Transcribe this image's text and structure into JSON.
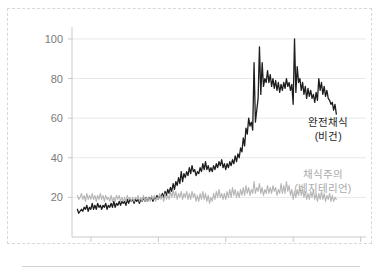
{
  "chart_data": {
    "type": "line",
    "title": "",
    "subtitle": "",
    "xlabel": "",
    "ylabel": "",
    "xlim": [
      2003.6,
      2025.4
    ],
    "ylim": [
      0,
      104
    ],
    "grid": true,
    "grid_axis": "y",
    "legend_position": "inline-right",
    "x_ticks": [
      "2005",
      "2010",
      "2015",
      "2020",
      "2025"
    ],
    "x_tick_values": [
      2005,
      2010,
      2015,
      2020,
      2025
    ],
    "y_ticks": [
      "20",
      "40",
      "60",
      "80",
      "100"
    ],
    "y_tick_values": [
      20,
      40,
      60,
      80,
      100
    ],
    "series": [
      {
        "name": "완전채식 (비건)",
        "label_line1": "완전채식",
        "label_line2": "(비건)",
        "color": "#1d1d1d",
        "label_x": 2022.6,
        "label_y": 56,
        "x": [
          2004.0,
          2004.1,
          2004.2,
          2004.3,
          2004.4,
          2004.5,
          2004.6,
          2004.7,
          2004.8,
          2004.9,
          2005.0,
          2005.1,
          2005.2,
          2005.3,
          2005.4,
          2005.5,
          2005.6,
          2005.7,
          2005.8,
          2005.9,
          2006.0,
          2006.1,
          2006.2,
          2006.3,
          2006.4,
          2006.5,
          2006.6,
          2006.7,
          2006.8,
          2006.9,
          2007.0,
          2007.1,
          2007.2,
          2007.3,
          2007.4,
          2007.5,
          2007.6,
          2007.7,
          2007.8,
          2007.9,
          2008.0,
          2008.1,
          2008.2,
          2008.3,
          2008.4,
          2008.5,
          2008.6,
          2008.7,
          2008.8,
          2008.9,
          2009.0,
          2009.1,
          2009.2,
          2009.3,
          2009.4,
          2009.5,
          2009.6,
          2009.7,
          2009.8,
          2009.9,
          2010.0,
          2010.1,
          2010.2,
          2010.3,
          2010.4,
          2010.5,
          2010.6,
          2010.7,
          2010.8,
          2010.9,
          2011.0,
          2011.1,
          2011.2,
          2011.3,
          2011.4,
          2011.5,
          2011.6,
          2011.7,
          2011.8,
          2011.9,
          2012.0,
          2012.1,
          2012.2,
          2012.3,
          2012.4,
          2012.5,
          2012.6,
          2012.7,
          2012.8,
          2012.9,
          2013.0,
          2013.1,
          2013.2,
          2013.3,
          2013.4,
          2013.5,
          2013.6,
          2013.7,
          2013.8,
          2013.9,
          2014.0,
          2014.1,
          2014.2,
          2014.3,
          2014.4,
          2014.5,
          2014.6,
          2014.7,
          2014.8,
          2014.9,
          2015.0,
          2015.1,
          2015.2,
          2015.3,
          2015.4,
          2015.5,
          2015.6,
          2015.7,
          2015.8,
          2015.9,
          2016.0,
          2016.1,
          2016.2,
          2016.3,
          2016.4,
          2016.5,
          2016.6,
          2016.7,
          2016.8,
          2016.9,
          2017.0,
          2017.1,
          2017.2,
          2017.3,
          2017.4,
          2017.5,
          2017.6,
          2017.7,
          2017.8,
          2017.9,
          2018.0,
          2018.1,
          2018.2,
          2018.3,
          2018.4,
          2018.5,
          2018.6,
          2018.7,
          2018.8,
          2018.9,
          2019.0,
          2019.1,
          2019.2,
          2019.3,
          2019.4,
          2019.5,
          2019.6,
          2019.7,
          2019.8,
          2019.9,
          2020.0,
          2020.1,
          2020.2,
          2020.3,
          2020.4,
          2020.5,
          2020.6,
          2020.7,
          2020.8,
          2020.9,
          2021.0,
          2021.1,
          2021.2,
          2021.3,
          2021.4,
          2021.5,
          2021.6,
          2021.7,
          2021.8,
          2021.9,
          2022.0,
          2022.1,
          2022.2,
          2022.3,
          2022.4,
          2022.5,
          2022.6,
          2022.7,
          2022.8,
          2022.9,
          2023.0,
          2023.1,
          2023.2
        ],
        "y": [
          14,
          12,
          13,
          14,
          13,
          15,
          14,
          16,
          13,
          15,
          14,
          17,
          14,
          16,
          14,
          17,
          15,
          16,
          14,
          16,
          15,
          17,
          14,
          16,
          15,
          17,
          15,
          18,
          15,
          17,
          16,
          18,
          16,
          18,
          17,
          18,
          16,
          19,
          17,
          19,
          18,
          19,
          17,
          19,
          18,
          19,
          17,
          19,
          18,
          20,
          18,
          20,
          18,
          20,
          19,
          20,
          18,
          20,
          19,
          21,
          19,
          21,
          20,
          22,
          20,
          23,
          21,
          24,
          22,
          25,
          23,
          27,
          24,
          28,
          26,
          30,
          27,
          33,
          28,
          32,
          30,
          33,
          31,
          35,
          32,
          36,
          33,
          34,
          31,
          33,
          32,
          35,
          33,
          37,
          34,
          38,
          34,
          36,
          33,
          35,
          33,
          36,
          34,
          37,
          35,
          38,
          36,
          39,
          35,
          37,
          34,
          37,
          35,
          38,
          36,
          39,
          37,
          41,
          38,
          42,
          40,
          45,
          43,
          50,
          46,
          55,
          52,
          60,
          56,
          58,
          54,
          88,
          58,
          64,
          70,
          96,
          72,
          88,
          76,
          80,
          78,
          84,
          78,
          82,
          76,
          80,
          75,
          79,
          74,
          78,
          73,
          77,
          74,
          78,
          75,
          80,
          76,
          78,
          74,
          77,
          67,
          100,
          73,
          86,
          78,
          80,
          74,
          78,
          72,
          76,
          70,
          75,
          71,
          74,
          70,
          72,
          68,
          73,
          69,
          80,
          74,
          78,
          72,
          76,
          71,
          74,
          70,
          69,
          67,
          68,
          64,
          67,
          62
        ]
      },
      {
        "name": "채식주의 (베지테리언)",
        "label_line1": "채식주의",
        "label_line2": "(베지테리언)",
        "color": "#b5b5b5",
        "label_x": 2022.2,
        "label_y": 30,
        "x": [
          2004.0,
          2004.1,
          2004.2,
          2004.3,
          2004.4,
          2004.5,
          2004.6,
          2004.7,
          2004.8,
          2004.9,
          2005.0,
          2005.1,
          2005.2,
          2005.3,
          2005.4,
          2005.5,
          2005.6,
          2005.7,
          2005.8,
          2005.9,
          2006.0,
          2006.1,
          2006.2,
          2006.3,
          2006.4,
          2006.5,
          2006.6,
          2006.7,
          2006.8,
          2006.9,
          2007.0,
          2007.1,
          2007.2,
          2007.3,
          2007.4,
          2007.5,
          2007.6,
          2007.7,
          2007.8,
          2007.9,
          2008.0,
          2008.1,
          2008.2,
          2008.3,
          2008.4,
          2008.5,
          2008.6,
          2008.7,
          2008.8,
          2008.9,
          2009.0,
          2009.1,
          2009.2,
          2009.3,
          2009.4,
          2009.5,
          2009.6,
          2009.7,
          2009.8,
          2009.9,
          2010.0,
          2010.1,
          2010.2,
          2010.3,
          2010.4,
          2010.5,
          2010.6,
          2010.7,
          2010.8,
          2010.9,
          2011.0,
          2011.1,
          2011.2,
          2011.3,
          2011.4,
          2011.5,
          2011.6,
          2011.7,
          2011.8,
          2011.9,
          2012.0,
          2012.1,
          2012.2,
          2012.3,
          2012.4,
          2012.5,
          2012.6,
          2012.7,
          2012.8,
          2012.9,
          2013.0,
          2013.1,
          2013.2,
          2013.3,
          2013.4,
          2013.5,
          2013.6,
          2013.7,
          2013.8,
          2013.9,
          2014.0,
          2014.1,
          2014.2,
          2014.3,
          2014.4,
          2014.5,
          2014.6,
          2014.7,
          2014.8,
          2014.9,
          2015.0,
          2015.1,
          2015.2,
          2015.3,
          2015.4,
          2015.5,
          2015.6,
          2015.7,
          2015.8,
          2015.9,
          2016.0,
          2016.1,
          2016.2,
          2016.3,
          2016.4,
          2016.5,
          2016.6,
          2016.7,
          2016.8,
          2016.9,
          2017.0,
          2017.1,
          2017.2,
          2017.3,
          2017.4,
          2017.5,
          2017.6,
          2017.7,
          2017.8,
          2017.9,
          2018.0,
          2018.1,
          2018.2,
          2018.3,
          2018.4,
          2018.5,
          2018.6,
          2018.7,
          2018.8,
          2018.9,
          2019.0,
          2019.1,
          2019.2,
          2019.3,
          2019.4,
          2019.5,
          2019.6,
          2019.7,
          2019.8,
          2019.9,
          2020.0,
          2020.1,
          2020.2,
          2020.3,
          2020.4,
          2020.5,
          2020.6,
          2020.7,
          2020.8,
          2020.9,
          2021.0,
          2021.1,
          2021.2,
          2021.3,
          2021.4,
          2021.5,
          2021.6,
          2021.7,
          2021.8,
          2021.9,
          2022.0,
          2022.1,
          2022.2,
          2022.3,
          2022.4,
          2022.5,
          2022.6,
          2022.7,
          2022.8,
          2022.9,
          2023.0,
          2023.1,
          2023.2
        ],
        "y": [
          21,
          19,
          20,
          22,
          19,
          21,
          18,
          22,
          19,
          21,
          19,
          22,
          19,
          21,
          18,
          21,
          19,
          22,
          19,
          21,
          18,
          21,
          19,
          20,
          18,
          21,
          18,
          20,
          18,
          21,
          19,
          21,
          18,
          20,
          18,
          20,
          18,
          21,
          19,
          20,
          18,
          20,
          18,
          20,
          19,
          21,
          18,
          20,
          18,
          21,
          18,
          20,
          18,
          20,
          18,
          21,
          19,
          21,
          18,
          20,
          19,
          22,
          19,
          21,
          18,
          22,
          19,
          21,
          19,
          23,
          20,
          24,
          20,
          23,
          19,
          22,
          20,
          23,
          19,
          22,
          20,
          23,
          19,
          22,
          19,
          23,
          20,
          22,
          18,
          21,
          18,
          22,
          19,
          23,
          19,
          22,
          18,
          21,
          17,
          20,
          18,
          22,
          19,
          23,
          20,
          24,
          20,
          22,
          19,
          22,
          19,
          23,
          20,
          24,
          20,
          25,
          21,
          24,
          20,
          23,
          20,
          24,
          21,
          25,
          21,
          26,
          22,
          25,
          21,
          24,
          22,
          28,
          22,
          25,
          23,
          27,
          22,
          25,
          21,
          24,
          22,
          26,
          22,
          25,
          22,
          26,
          23,
          25,
          21,
          24,
          22,
          27,
          22,
          26,
          22,
          28,
          23,
          26,
          21,
          24,
          19,
          23,
          20,
          24,
          21,
          25,
          21,
          24,
          20,
          23,
          19,
          22,
          19,
          23,
          20,
          24,
          19,
          22,
          18,
          22,
          19,
          23,
          19,
          22,
          18,
          21,
          19,
          22,
          18,
          21,
          18,
          20,
          19
        ]
      }
    ]
  }
}
